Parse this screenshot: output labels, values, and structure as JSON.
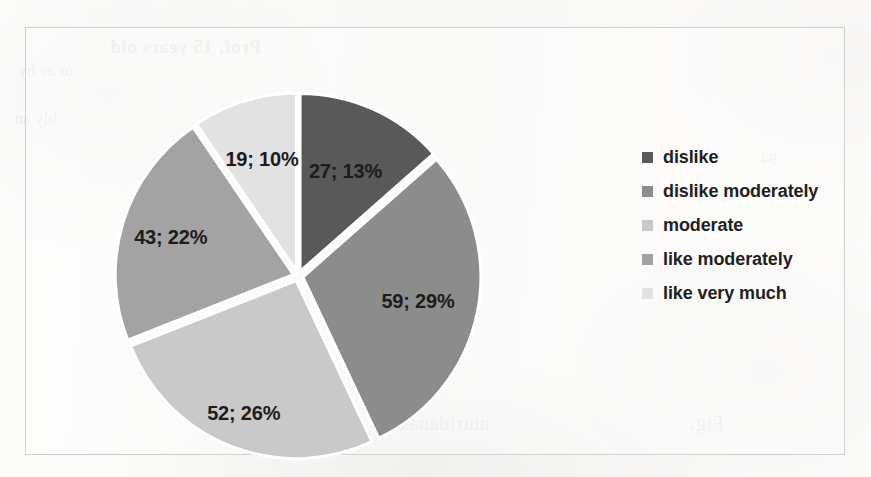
{
  "chart_data": {
    "type": "pie",
    "title": "",
    "subtitle": "",
    "xlabel": "",
    "ylabel": "",
    "grid": false,
    "legend_position": "right",
    "total": 200,
    "start_angle_deg": 0,
    "direction": "clockwise",
    "exploded": true,
    "categories": [
      "dislike",
      "dislike moderately",
      "moderate",
      "like moderately",
      "like very much"
    ],
    "values": [
      27,
      59,
      52,
      43,
      19
    ],
    "percents": [
      13,
      29,
      26,
      22,
      10
    ],
    "colors": [
      "#595959",
      "#8c8c8c",
      "#c9c9c9",
      "#a3a3a3",
      "#e2e2e2"
    ],
    "slices": [
      {
        "label": "dislike",
        "value": 27,
        "percent": 13,
        "data_label": "27; 13%",
        "color": "#595959",
        "start_deg": 0,
        "end_deg": 48.6
      },
      {
        "label": "dislike moderately",
        "value": 59,
        "percent": 29,
        "data_label": "59; 29%",
        "color": "#8c8c8c",
        "start_deg": 48.6,
        "end_deg": 154.8
      },
      {
        "label": "moderate",
        "value": 52,
        "percent": 26,
        "data_label": "52; 26%",
        "color": "#c9c9c9",
        "start_deg": 154.8,
        "end_deg": 248.4
      },
      {
        "label": "like moderately",
        "value": 43,
        "percent": 22,
        "data_label": "43; 22%",
        "color": "#a3a3a3",
        "start_deg": 248.4,
        "end_deg": 325.8
      },
      {
        "label": "like very much",
        "value": 19,
        "percent": 10,
        "data_label": "19; 10%",
        "color": "#e2e2e2",
        "start_deg": 325.8,
        "end_deg": 360
      }
    ]
  },
  "labels": {
    "dislike": "27; 13%",
    "dislike_moderately": "59; 29%",
    "moderate": "52; 26%",
    "like_moderately": "43; 22%",
    "like_very_much": "19; 10%"
  },
  "legend": {
    "items": [
      {
        "label": "dislike",
        "color": "#595959"
      },
      {
        "label": "dislike moderately",
        "color": "#8c8c8c"
      },
      {
        "label": " moderate",
        "color": "#c9c9c9"
      },
      {
        "label": "like moderately",
        "color": "#a3a3a3"
      },
      {
        "label": "like very much",
        "color": "#e2e2e2"
      }
    ]
  },
  "scan_artifacts": {
    "bleed_top": "Prof. 15 years old",
    "bleed_bottom": "nutridanasm",
    "bleed_bottom_right": "Fig.",
    "bleed_left_a": "ot ae by",
    "bleed_left_b": "bly an",
    "bleed_right_a": "94"
  }
}
